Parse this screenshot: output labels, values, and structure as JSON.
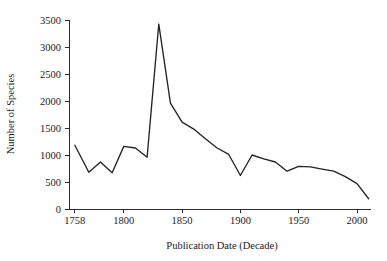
{
  "chart_data": {
    "type": "line",
    "title": "",
    "xlabel": "Publication Date (Decade)",
    "ylabel": "Number of Species",
    "xlim": [
      1753,
      2012
    ],
    "ylim": [
      0,
      3500
    ],
    "grid": false,
    "legend": false,
    "legend_position": "none",
    "line_color": "#242424",
    "axis_color": "#2b2b2b",
    "xticks": [
      1758,
      1800,
      1850,
      1900,
      1950,
      2000
    ],
    "xtick_labels": [
      "1758",
      "1800",
      "1850",
      "1900",
      "1950",
      "2000"
    ],
    "yticks": [
      0,
      500,
      1000,
      1500,
      2000,
      2500,
      3000,
      3500
    ],
    "ytick_labels": [
      "0",
      "500",
      "1000",
      "1500",
      "2000",
      "2500",
      "3000",
      "3500"
    ],
    "x": [
      1758,
      1770,
      1780,
      1790,
      1800,
      1810,
      1820,
      1830,
      1840,
      1850,
      1860,
      1870,
      1880,
      1890,
      1900,
      1910,
      1920,
      1930,
      1940,
      1950,
      1960,
      1970,
      1980,
      1990,
      2000,
      2010
    ],
    "series": [
      {
        "name": "Number of Species",
        "values": [
          1180,
          680,
          870,
          670,
          1160,
          1130,
          960,
          3425,
          1960,
          1610,
          1480,
          1300,
          1130,
          1010,
          620,
          1000,
          930,
          870,
          700,
          790,
          780,
          740,
          700,
          600,
          470,
          190
        ]
      }
    ]
  },
  "figure": {
    "background": "#ffffff",
    "plot_left_px": 69,
    "plot_right_px": 371,
    "plot_top_px": 20,
    "plot_bottom_px": 209
  }
}
